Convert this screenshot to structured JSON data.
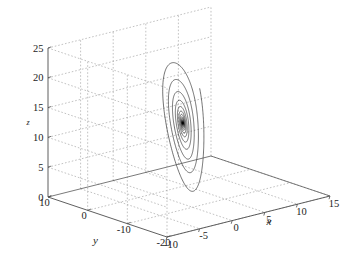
{
  "figure": {
    "title": "",
    "background_color": "#ffffff",
    "curve_color": "#000000",
    "axis_color": "#4d4d4d",
    "grid_color": "#999999",
    "width": 354,
    "height": 269
  },
  "chart_data": {
    "type": "line",
    "subtype": "3d-phase-portrait",
    "title": "",
    "xlabel": "x",
    "ylabel": "y",
    "zlabel": "z",
    "grid": true,
    "legend": false,
    "legend_position": "none",
    "projection": "3d-orthographic",
    "xlim": [
      -10,
      15
    ],
    "ylim": [
      -20,
      10
    ],
    "zlim": [
      0,
      25
    ],
    "xticks": [
      -10,
      -5,
      0,
      5,
      10,
      15
    ],
    "xtick_labels": [
      "-10",
      "-5",
      "0",
      "5",
      "10",
      "15"
    ],
    "yticks": [
      -20,
      -10,
      0,
      10
    ],
    "ytick_labels": [
      "-20",
      "-10",
      "0",
      "10"
    ],
    "zticks": [
      0,
      5,
      10,
      15,
      20,
      25
    ],
    "ztick_labels": [
      "0",
      "5",
      "10",
      "15",
      "20",
      "25"
    ],
    "series": [
      {
        "name": "attractor-trajectory",
        "color": "#000000",
        "linewidth": 0.55,
        "system": "chaotic-attractor",
        "description": "Dense chaotic orbit: flat spiral disc near z=0 plus a tall nested cone of arcs reaching z~24",
        "params": {
          "a": 36,
          "b": 3,
          "c": 20,
          "dt": 0.004,
          "steps": 26000
        },
        "initial_state": [
          0.6,
          0.2,
          0.8
        ]
      }
    ],
    "annotations": []
  },
  "axes": {
    "x_axis_name": "x-axis",
    "y_axis_name": "y-axis",
    "z_axis_name": "z-axis"
  }
}
